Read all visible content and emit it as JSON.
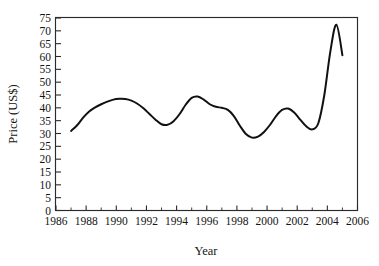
{
  "chart_data": {
    "type": "line",
    "title": "",
    "subtitle": "",
    "xlabel": "Year",
    "ylabel": "Price (US$)",
    "xlim": [
      1986,
      2006
    ],
    "ylim": [
      0,
      75
    ],
    "grid": false,
    "legend": null,
    "line_color": "#111111",
    "background_color": "#ffffff",
    "axis_color": "#2b2b2b",
    "x_ticks_major": [
      1986,
      1988,
      1990,
      1992,
      1994,
      1996,
      1998,
      2000,
      2002,
      2004,
      2006
    ],
    "x_tick_labels": [
      "1986",
      "1988",
      "1990",
      "1992",
      "1994",
      "1996",
      "1998",
      "2000",
      "2002",
      "2004",
      "2006"
    ],
    "x_ticks_minor": [
      1987,
      1989,
      1991,
      1993,
      1995,
      1997,
      1999,
      2001,
      2003,
      2005
    ],
    "y_ticks_major": [
      0,
      5,
      10,
      15,
      20,
      25,
      30,
      35,
      40,
      45,
      50,
      55,
      60,
      65,
      70,
      75
    ],
    "y_tick_labels": [
      "0",
      "5",
      "10",
      "15",
      "20",
      "25",
      "30",
      "35",
      "40",
      "45",
      "50",
      "55",
      "60",
      "65",
      "70",
      "75"
    ],
    "series": [
      {
        "name": "Price",
        "x": [
          1987.0,
          1987.4,
          1987.8,
          1988.2,
          1988.6,
          1989.0,
          1989.4,
          1989.8,
          1990.2,
          1990.6,
          1991.0,
          1991.4,
          1991.8,
          1992.2,
          1992.6,
          1993.0,
          1993.4,
          1993.8,
          1994.2,
          1994.6,
          1995.0,
          1995.4,
          1995.8,
          1996.2,
          1996.6,
          1997.0,
          1997.4,
          1997.8,
          1998.2,
          1998.6,
          1999.0,
          1999.4,
          1999.8,
          2000.2,
          2000.6,
          2001.0,
          2001.4,
          2001.8,
          2002.2,
          2002.6,
          2003.0,
          2003.4,
          2003.8,
          2004.2,
          2004.6,
          2005.0
        ],
        "y": [
          31.0,
          33.2,
          36.2,
          38.6,
          40.2,
          41.4,
          42.4,
          43.2,
          43.5,
          43.4,
          42.8,
          41.6,
          39.8,
          37.6,
          35.4,
          33.6,
          33.4,
          34.8,
          37.6,
          41.2,
          43.9,
          44.4,
          43.2,
          41.4,
          40.4,
          40.0,
          39.2,
          36.8,
          33.0,
          29.8,
          28.4,
          28.8,
          30.6,
          33.4,
          36.8,
          39.2,
          39.7,
          38.2,
          35.4,
          32.8,
          31.6,
          34.0,
          45.0,
          62.0,
          72.4,
          60.5
        ]
      }
    ]
  },
  "axis": {
    "x_label": "Year",
    "y_label": "Price (US$)"
  }
}
